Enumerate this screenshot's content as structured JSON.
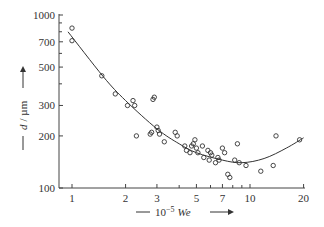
{
  "chart_data": {
    "type": "scatter",
    "title": "",
    "xlabel": "10^-5 We",
    "ylabel": "d / µm",
    "x_scale": "log",
    "y_scale": "log",
    "xlim": [
      0.9,
      21
    ],
    "ylim": [
      100,
      1000
    ],
    "grid": false,
    "legend": null,
    "x_ticks": [
      1,
      2,
      3,
      5,
      7,
      10,
      20
    ],
    "x_tick_labels": [
      "1",
      "2",
      "3",
      "5",
      "7",
      "10",
      "20"
    ],
    "x_minor_ticks": [
      4,
      6,
      8,
      9
    ],
    "y_ticks": [
      100,
      200,
      300,
      500,
      700,
      1000
    ],
    "y_tick_labels": [
      "100",
      "200",
      "300",
      "500",
      "700",
      "1000"
    ],
    "y_minor_ticks": [
      400,
      600,
      800,
      900
    ],
    "series": [
      {
        "name": "measured",
        "marker": "open-circle",
        "points": [
          [
            1.0,
            840
          ],
          [
            1.0,
            710
          ],
          [
            1.47,
            445
          ],
          [
            1.75,
            350
          ],
          [
            2.05,
            300
          ],
          [
            2.2,
            320
          ],
          [
            2.25,
            300
          ],
          [
            2.3,
            200
          ],
          [
            2.75,
            205
          ],
          [
            2.8,
            210
          ],
          [
            2.85,
            325
          ],
          [
            2.9,
            335
          ],
          [
            3.0,
            225
          ],
          [
            3.05,
            215
          ],
          [
            3.1,
            205
          ],
          [
            3.3,
            185
          ],
          [
            3.8,
            210
          ],
          [
            3.9,
            200
          ],
          [
            4.3,
            175
          ],
          [
            4.4,
            165
          ],
          [
            4.6,
            160
          ],
          [
            4.7,
            175
          ],
          [
            4.8,
            180
          ],
          [
            4.9,
            190
          ],
          [
            5.0,
            170
          ],
          [
            5.1,
            160
          ],
          [
            5.4,
            175
          ],
          [
            5.5,
            150
          ],
          [
            5.8,
            165
          ],
          [
            5.9,
            145
          ],
          [
            6.0,
            160
          ],
          [
            6.1,
            155
          ],
          [
            6.4,
            140
          ],
          [
            6.6,
            150
          ],
          [
            6.7,
            145
          ],
          [
            7.0,
            170
          ],
          [
            7.2,
            160
          ],
          [
            7.5,
            120
          ],
          [
            7.7,
            115
          ],
          [
            8.2,
            145
          ],
          [
            8.5,
            180
          ],
          [
            8.7,
            140
          ],
          [
            9.5,
            135
          ],
          [
            11.5,
            125
          ],
          [
            13.5,
            135
          ],
          [
            14.0,
            200
          ],
          [
            19.0,
            190
          ]
        ]
      },
      {
        "name": "fit",
        "type": "line",
        "points": [
          [
            0.95,
            800
          ],
          [
            1.5,
            440
          ],
          [
            2.0,
            320
          ],
          [
            3.0,
            220
          ],
          [
            4.0,
            180
          ],
          [
            5.0,
            160
          ],
          [
            7.0,
            145
          ],
          [
            9.0,
            140
          ],
          [
            12.0,
            148
          ],
          [
            16.0,
            170
          ],
          [
            20.0,
            195
          ]
        ]
      }
    ]
  },
  "axes": {
    "x_label_prefix": "10",
    "x_label_exponent": "−5",
    "x_label_var": "We",
    "y_label_var": "d",
    "y_label_unit": "/ µm"
  }
}
